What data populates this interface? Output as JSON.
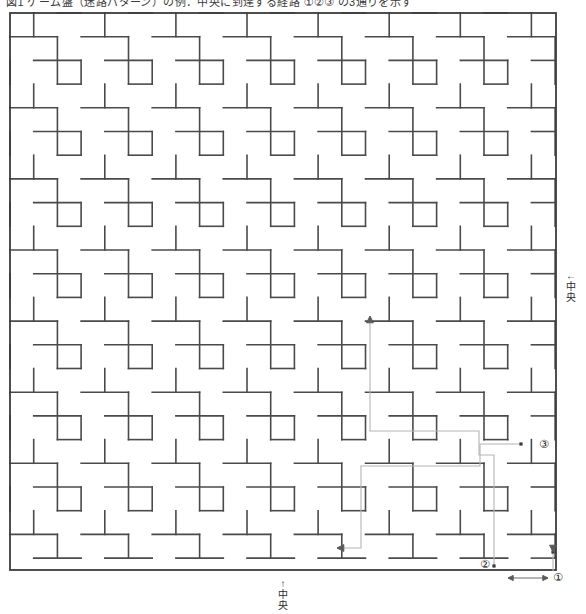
{
  "page": {
    "header_text": "図1 ゲーム盤（迷路パターン）の例：中央に到達する経路 ①②③ の3通りを示す",
    "bg_color": "#ffffff",
    "wall_color": "#4a4a4a",
    "route_color": "#b4b4b4",
    "arrow_color": "#5a5a5a",
    "border_color": "#3c3c3c"
  },
  "maze": {
    "name": "pinwheel-tile-maze",
    "x": 10,
    "y": 13,
    "width": 546,
    "height": 557,
    "cols": 23,
    "rows": 23,
    "cell": 23.7,
    "tile_period_cells": 3
  },
  "annotations": {
    "center_right": {
      "arrow": "←",
      "label": "中央",
      "line1": "中",
      "line2": "央"
    },
    "center_bottom": {
      "arrow": "↑",
      "label": "中央",
      "line1": "中",
      "line2": "央"
    },
    "markers": [
      {
        "id": "marker-1",
        "label": "①",
        "x": 553,
        "y": 572
      },
      {
        "id": "marker-2",
        "label": "②",
        "x": 480,
        "y": 559
      },
      {
        "id": "marker-3",
        "label": "③",
        "x": 539,
        "y": 439
      }
    ]
  },
  "routes": [
    {
      "name": "route-1",
      "label": "①",
      "points": "553,552 553,571"
    },
    {
      "name": "route-2",
      "label": "②",
      "points": "494,566 494,455 479,455 479,431 370,431 370,318"
    },
    {
      "name": "route-3",
      "label": "③",
      "points": "521,444 480,444 480,466 361,466 361,548 337,548"
    }
  ],
  "scale_bar": {
    "name": "scale-bar",
    "x1": 508,
    "x2": 548,
    "y": 578
  }
}
